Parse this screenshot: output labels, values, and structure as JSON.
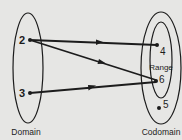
{
  "diagram": {
    "colors": {
      "background": "#e6e6e4",
      "ink": "#1c1c1c"
    },
    "sets": {
      "domain": {
        "label": "Domain",
        "elements": [
          "2",
          "3"
        ]
      },
      "codomain": {
        "label": "Codomain",
        "elements": [
          "4",
          "6",
          "5"
        ]
      },
      "range": {
        "label": "Range",
        "elements": [
          "4",
          "6"
        ]
      }
    },
    "points": {
      "d2": {
        "label": "2"
      },
      "d3": {
        "label": "3"
      },
      "c4": {
        "label": "4"
      },
      "c6": {
        "label": "6"
      },
      "c5": {
        "label": "5"
      }
    },
    "mappings": [
      {
        "from": "2",
        "to": "4"
      },
      {
        "from": "2",
        "to": "6"
      },
      {
        "from": "3",
        "to": "6"
      }
    ]
  }
}
